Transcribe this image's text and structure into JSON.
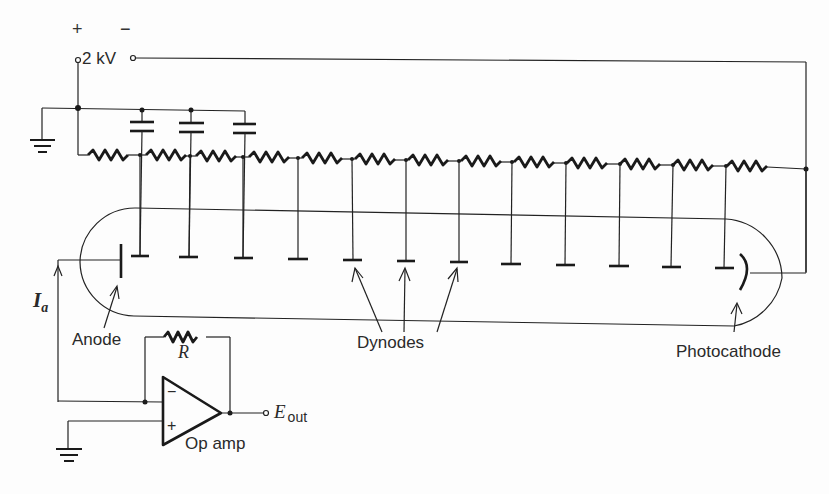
{
  "figure": {
    "supply": {
      "plus_sign": "+",
      "minus_sign": "−",
      "voltage_label": "2 kV"
    },
    "labels": {
      "anode": "Anode",
      "dynodes": "Dynodes",
      "photocathode": "Photocathode",
      "resistor": "R",
      "op_amp": "Op amp",
      "output_main": "E",
      "output_sub": "out",
      "current_main": "I",
      "current_sub": "a",
      "inv_input": "−",
      "noninv_input": "+"
    },
    "components": {
      "divider_resistors": 13,
      "bypass_capacitors": 3,
      "dynode_count": 12
    },
    "colors": {
      "ink": "#222222",
      "background": "#fdfdfd"
    }
  }
}
